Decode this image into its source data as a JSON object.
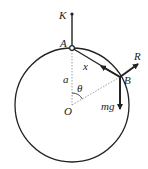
{
  "diagram": {
    "colors": {
      "stroke": "#222222",
      "dotted": "#888888",
      "background": "#ffffff"
    },
    "labels": {
      "K": "K",
      "A": "A",
      "B": "B",
      "O": "O",
      "R": "R",
      "x": "x",
      "a": "a",
      "theta": "θ",
      "mg": "mg"
    },
    "elements": [
      "circle of radius a centered at O",
      "vertical string from K to A at top of circle",
      "dotted radius O to A",
      "dotted radius O to B",
      "angle theta at O between OA and OB",
      "string AB of length x with tension arrow toward A",
      "normal reaction R at B directed outward",
      "weight mg at B directed downward"
    ]
  }
}
